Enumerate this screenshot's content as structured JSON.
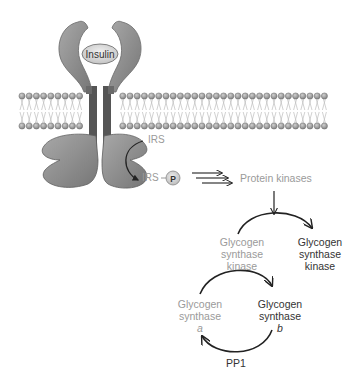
{
  "diagram": {
    "colors": {
      "receptor": "#8c8c8c",
      "receptor_dark": "#6e6e6e",
      "membrane_head": "#9e9e9e",
      "membrane_tail": "#c8c8c8",
      "inactive_text": "#9a9a9a",
      "active_text": "#333333",
      "arrow": "#222222"
    },
    "labels": {
      "insulin": "Insulin",
      "irs": "IRS",
      "irs_p": "IRS",
      "phospho": "P",
      "protein_kinases": "Protein kinases",
      "gsk_inactive": [
        "Glycogen",
        "synthase",
        "kinase"
      ],
      "gsk_active": [
        "Glycogen",
        "synthase",
        "kinase"
      ],
      "gs_a": [
        "Glycogen",
        "synthase",
        "a"
      ],
      "gs_b": [
        "Glycogen",
        "synthase",
        "b"
      ],
      "pp1": "PP1"
    }
  }
}
